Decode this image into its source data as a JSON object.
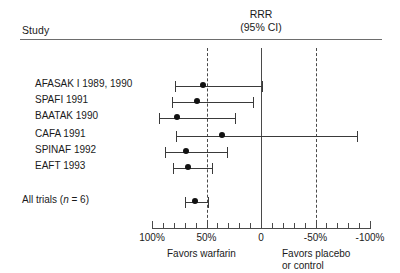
{
  "header": {
    "study_label": "Study",
    "measure_line1": "RRR",
    "measure_line2": "(95% CI)"
  },
  "axis": {
    "tick_labels": [
      "100%",
      "50%",
      "0",
      "-50%",
      "-100%"
    ],
    "tick_values": [
      100,
      50,
      0,
      -50,
      -100
    ],
    "favors_left": "Favors warfarin",
    "favors_right_line1": "Favors placebo",
    "favors_right_line2": "or control",
    "reference_line_value": 0,
    "dashed_line_values": [
      50,
      -50
    ]
  },
  "studies": [
    {
      "label": "AFASAK I 1989, 1990",
      "rrr": 53,
      "ci_low": 79,
      "ci_high": -1
    },
    {
      "label": "SPAFI 1991",
      "rrr": 59,
      "ci_low": 82,
      "ci_high": 7
    },
    {
      "label": "BAATAK 1990",
      "rrr": 77,
      "ci_low": 94,
      "ci_high": 24
    },
    {
      "label": "CAFA 1991",
      "rrr": 36,
      "ci_low": 78,
      "ci_high": -88
    },
    {
      "label": "SPINAF 1992",
      "rrr": 69,
      "ci_low": 88,
      "ci_high": 31
    },
    {
      "label": "EAFT 1993",
      "rrr": 67,
      "ci_low": 81,
      "ci_high": 45
    }
  ],
  "summary": {
    "label_prefix": "All trials (",
    "label_italic": "n",
    "label_suffix": " = 6)",
    "rrr": 61,
    "ci_low": 70,
    "ci_high": 49
  },
  "chart_data": {
    "type": "forest",
    "title": "RRR (95% CI)",
    "xlabel": "Relative risk reduction",
    "ylabel": "Study",
    "xlim": [
      100,
      -100
    ],
    "x_ticks": [
      100,
      50,
      0,
      -50,
      -100
    ],
    "x_tick_labels": [
      "100%",
      "50%",
      "0",
      "-50%",
      "-100%"
    ],
    "x_minor_tick_step": 10,
    "reference_line": 0,
    "dashed_reference_lines": [
      50,
      -50
    ],
    "grid": false,
    "legend": "none",
    "categories": [
      "AFASAK I 1989, 1990",
      "SPAFI 1991",
      "BAATAK 1990",
      "CAFA 1991",
      "SPINAF 1992",
      "EAFT 1993",
      "All trials (n = 6)"
    ],
    "values": [
      53,
      59,
      77,
      36,
      69,
      67,
      61
    ],
    "ci_low": [
      79,
      82,
      94,
      78,
      88,
      81,
      70
    ],
    "ci_high": [
      -1,
      7,
      24,
      -88,
      31,
      45,
      49
    ],
    "annotations": [
      "Favors warfarin",
      "Favors placebo or control"
    ],
    "note": "Values are percent relative risk reduction; axis decreases left to right from 100% to -100%."
  },
  "geometry": {
    "x_at_100": 152,
    "x_at_minus100": 370,
    "row_tops": [
      76,
      92,
      108,
      126,
      142,
      158
    ],
    "summary_top": 192
  }
}
